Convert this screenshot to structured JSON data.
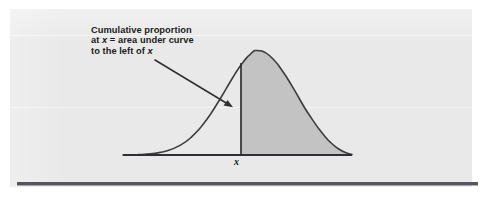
{
  "figure": {
    "caption_lines": [
      {
        "segments": [
          {
            "text": "Cumulative proportion",
            "italic": false
          }
        ]
      },
      {
        "segments": [
          {
            "text": "at ",
            "italic": false
          },
          {
            "text": "x",
            "italic": true
          },
          {
            "text": " = area under curve",
            "italic": false
          }
        ]
      },
      {
        "segments": [
          {
            "text": "to the left of ",
            "italic": false
          },
          {
            "text": "x",
            "italic": true
          }
        ]
      }
    ],
    "caption_plain": "Cumulative proportion at x = area under curve to the left of x",
    "x_axis_label": "x",
    "annotation_arrow": {
      "name": "callout-arrow",
      "from": {
        "x": 155,
        "y": 60
      },
      "to": {
        "x": 232,
        "y": 107
      },
      "points_to": "normal-curve"
    },
    "colors": {
      "page_background": "#e9e9e9",
      "paper_white": "#ffffff",
      "curve_stroke": "#3c3d40",
      "axis_stroke": "#2e2f32",
      "shaded_area_fill": "#c3c3c3",
      "bottom_rule": "#55565a",
      "text": "#1c1c1c"
    }
  },
  "chart_data": {
    "type": "area",
    "title": "",
    "subtitle": "",
    "xlabel": "x",
    "ylabel": "",
    "grid": false,
    "legend": null,
    "distribution": "normal",
    "mean_px": 255,
    "sd_px": 44,
    "axis": {
      "baseline_y_px": 155,
      "x_start_px": 123,
      "x_end_px": 352
    },
    "peak_px": {
      "x": 255,
      "y": 50
    },
    "marker": {
      "label": "x",
      "x_px": 241,
      "z_value": -0.32,
      "line_from_y_px": 155,
      "line_to_y_px": 53
    },
    "shaded_region": {
      "label": "area under curve",
      "from_px": 241,
      "to_px": 352,
      "side_rendered": "right-of-x",
      "fill": "#c3c3c3"
    },
    "curve_points_px": [
      {
        "x": 123,
        "y": 155
      },
      {
        "x": 140,
        "y": 154.6
      },
      {
        "x": 155,
        "y": 153.4
      },
      {
        "x": 168,
        "y": 150.6
      },
      {
        "x": 180,
        "y": 145.4
      },
      {
        "x": 191,
        "y": 137.5
      },
      {
        "x": 201,
        "y": 127.0
      },
      {
        "x": 211,
        "y": 113.5
      },
      {
        "x": 221,
        "y": 97.5
      },
      {
        "x": 231,
        "y": 80.5
      },
      {
        "x": 241,
        "y": 65.0
      },
      {
        "x": 249,
        "y": 55.5
      },
      {
        "x": 255,
        "y": 50.5
      },
      {
        "x": 262,
        "y": 51.0
      },
      {
        "x": 270,
        "y": 56.0
      },
      {
        "x": 279,
        "y": 66.0
      },
      {
        "x": 289,
        "y": 81.0
      },
      {
        "x": 299,
        "y": 98.0
      },
      {
        "x": 309,
        "y": 114.5
      },
      {
        "x": 319,
        "y": 129.0
      },
      {
        "x": 329,
        "y": 141.0
      },
      {
        "x": 338,
        "y": 148.5
      },
      {
        "x": 346,
        "y": 152.8
      },
      {
        "x": 352,
        "y": 154.5
      }
    ]
  }
}
